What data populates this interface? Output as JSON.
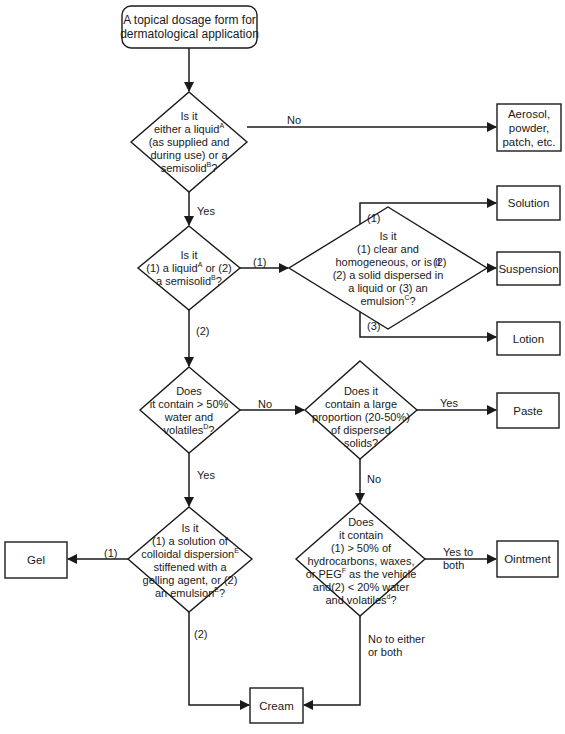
{
  "diagram": {
    "type": "flowchart",
    "start": {
      "line1": "A topical dosage form for",
      "line2": "dermatological application"
    },
    "decisions": {
      "liquid_or_semisolid": {
        "l1": "Is it",
        "l2a": "either a liquid",
        "l2sup": "A",
        "l3": "(as supplied and",
        "l4": "during use) or a",
        "l5a": "semisolid",
        "l5sup": "B",
        "l5b": "?"
      },
      "which_one": {
        "l1": "Is it",
        "l2a": "(1) a liquid",
        "l2sup": "A",
        "l2b": " or (2)",
        "l3a": "a semisolid",
        "l3sup": "B",
        "l3b": "?"
      },
      "liquid_type": {
        "l1": "Is it",
        "l2": "(1) clear and",
        "l3": "homogeneous, or is it",
        "l4": "(2) a solid dispersed in",
        "l5": "a liquid or (3) an",
        "l6a": "emulsion",
        "l6sup": "C",
        "l6b": "?"
      },
      "water_content": {
        "l1": "Does",
        "l2": "it contain > 50%",
        "l3": "water and",
        "l4a": "volatiles",
        "l4sup": "D",
        "l4b": "?"
      },
      "dispersed_solids": {
        "l1": "Does it",
        "l2": "contain a large",
        "l3": "proportion (20-50%)",
        "l4": "of dispersed",
        "l5": "solids?"
      },
      "gel_or_emulsion": {
        "l1": "Is it",
        "l2": "(1) a solution of",
        "l3a": "colloidal dispersion",
        "l3sup": "E",
        "l4": "stiffened with a",
        "l5": "gelling agent, or (2)",
        "l6a": "an emulsion",
        "l6sup": "E",
        "l6b": "?"
      },
      "ointment_check": {
        "l1": "Does",
        "l2": "it contain",
        "l3": "(1) > 50% of",
        "l4": "hydrocarbons, waxes,",
        "l5a": "or PEG",
        "l5sup": "F",
        "l5b": " as the vehicle",
        "l6": "and(2) < 20% water",
        "l7a": "and volatiles",
        "l7sup": "d",
        "l7b": "?"
      }
    },
    "outcomes": {
      "aerosol": {
        "l1": "Aerosol,",
        "l2": "powder,",
        "l3": "patch, etc."
      },
      "solution": "Solution",
      "suspension": "Suspension",
      "lotion": "Lotion",
      "paste": "Paste",
      "gel": "Gel",
      "ointment": "Ointment",
      "cream": "Cream"
    },
    "edge_labels": {
      "no_to_aerosol": "No",
      "yes_down_1": "Yes",
      "one_to_liquid_type": "(1)",
      "two_down": "(2)",
      "opt1_solution": "(1)",
      "opt2_suspension": "(2)",
      "opt3_lotion": "(3)",
      "no_to_solids": "No",
      "yes_to_paste": "Yes",
      "no_down_solids": "No",
      "yes_down_water": "Yes",
      "one_to_gel": "(1)",
      "two_to_cream": "(2)",
      "yes_to_both_l1": "Yes to",
      "yes_to_both_l2": "both",
      "no_to_either_l1": "No to either",
      "no_to_either_l2": "or both"
    },
    "colors": {
      "stroke": "#1a1a1a",
      "background": "#ffffff"
    }
  }
}
